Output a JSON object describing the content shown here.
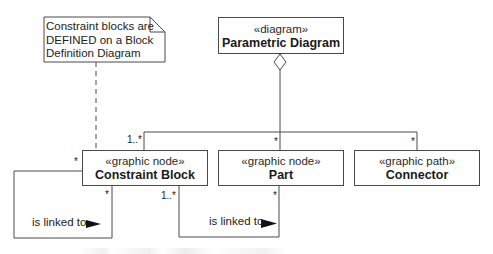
{
  "note": {
    "lines": [
      "Constraint blocks are",
      "DEFINED on a Block",
      "Definition Diagram"
    ]
  },
  "nodes": {
    "parametric_diagram": {
      "stereotype": "«diagram»",
      "name": "Parametric Diagram"
    },
    "constraint_block": {
      "stereotype": "«graphic node»",
      "name": "Constraint Block"
    },
    "part": {
      "stereotype": "«graphic node»",
      "name": "Part"
    },
    "connector": {
      "stereotype": "«graphic path»",
      "name": "Connector"
    }
  },
  "multiplicities": {
    "constraint_block_top": "1..*",
    "part_top": "*",
    "connector_top": "*",
    "constraint_block_left": "*",
    "constraint_block_bottom_left": "*",
    "constraint_block_bottom_right": "1..*",
    "part_bottom": "*"
  },
  "associations": {
    "self_link_label": "is linked to",
    "part_link_label": "is linked to"
  },
  "colors": {
    "line": "#4a4a4a",
    "text": "#1a1a1a",
    "background": "#ffffff"
  }
}
